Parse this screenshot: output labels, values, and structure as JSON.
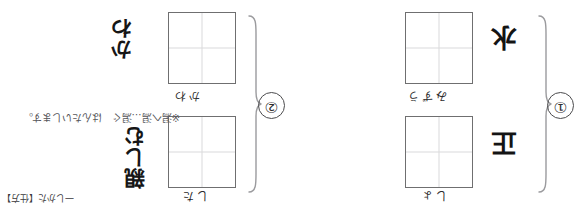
{
  "page": {
    "orientation": "rotated-180",
    "background_color": "#ffffff",
    "ink_color": "#1d1d1d",
    "cell_border_color": "#6f6f70",
    "cell_guide_color": "#d9d9dc"
  },
  "groups": [
    {
      "number_label": "①",
      "items": [
        {
          "kanji_prompt": "水",
          "furigana": "みずう",
          "handwritten_answer": ""
        },
        {
          "kanji_prompt": "正",
          "furigana": "しょ",
          "handwritten_answer": ""
        }
      ]
    },
    {
      "number_label": "②",
      "items": [
        {
          "kanji_prompt": "",
          "furigana": "かわ",
          "handwritten_answer": "かわ"
        },
        {
          "kanji_prompt": "",
          "furigana": "した",
          "handwritten_answer": "親しむ"
        }
      ]
    }
  ],
  "note": {
    "text": "※潟へ潟…潟ぐ　はんたいします。",
    "ruby": "こ"
  },
  "footer": {
    "reference": "一しかた【仕方】"
  }
}
